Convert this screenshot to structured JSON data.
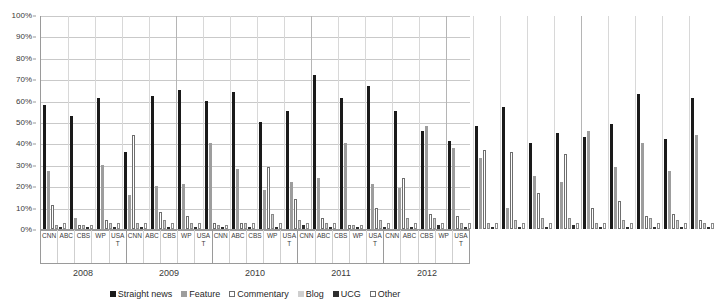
{
  "chart_data": {
    "type": "bar",
    "title": "",
    "subtitle": "",
    "xlabel": "",
    "ylabel": "",
    "ylim": [
      0,
      100
    ],
    "y_tick_labels": [
      "100%",
      "90%",
      "80%",
      "70%",
      "60%",
      "50%",
      "40%",
      "30%",
      "20%",
      "10%",
      "0%"
    ],
    "y_tick_values": [
      100,
      90,
      80,
      70,
      60,
      50,
      40,
      30,
      20,
      10,
      0
    ],
    "grid": "horizontal",
    "legend_position": "bottom",
    "group_labels": [
      "2008",
      "2009",
      "2010",
      "2011",
      "2012"
    ],
    "categories": [
      "CNN",
      "ABC",
      "CBS",
      "WP",
      "USA T"
    ],
    "series_names": [
      "Straight news",
      "Feature",
      "Commentary",
      "Blog",
      "UCG",
      "Other"
    ],
    "series_colors": [
      "#1a1a1a",
      "#9d9d9d",
      "#ffffff",
      "#cfcfcf",
      "#2f2f2f",
      "#ffffff"
    ],
    "groups": [
      {
        "year": "2008",
        "outlets": [
          {
            "name": "CNN",
            "values": [
              58,
              27,
              11,
              2,
              1,
              3
            ]
          },
          {
            "name": "ABC",
            "values": [
              53,
              5,
              2,
              2,
              1,
              2
            ]
          },
          {
            "name": "CBS",
            "values": [
              61,
              30,
              4,
              3,
              1,
              3
            ]
          },
          {
            "name": "WP",
            "values": [
              36,
              16,
              44,
              3,
              1,
              3
            ]
          },
          {
            "name": "USA T",
            "values": [
              62,
              20,
              8,
              4,
              1,
              3
            ]
          }
        ]
      },
      {
        "year": "2009",
        "outlets": [
          {
            "name": "CNN",
            "values": [
              65,
              21,
              6,
              3,
              1,
              3
            ]
          },
          {
            "name": "ABC",
            "values": [
              60,
              40,
              3,
              2,
              1,
              2
            ]
          },
          {
            "name": "CBS",
            "values": [
              64,
              28,
              3,
              3,
              1,
              3
            ]
          },
          {
            "name": "WP",
            "values": [
              50,
              18,
              29,
              7,
              1,
              3
            ]
          },
          {
            "name": "USA T",
            "values": [
              55,
              22,
              14,
              4,
              2,
              3
            ]
          }
        ]
      },
      {
        "year": "2010",
        "outlets": [
          {
            "name": "CNN",
            "values": [
              72,
              24,
              5,
              3,
              1,
              3
            ]
          },
          {
            "name": "ABC",
            "values": [
              61,
              40,
              2,
              2,
              1,
              2
            ]
          },
          {
            "name": "CBS",
            "values": [
              67,
              21,
              10,
              4,
              1,
              3
            ]
          },
          {
            "name": "WP",
            "values": [
              55,
              19,
              24,
              5,
              1,
              3
            ]
          },
          {
            "name": "USA T",
            "values": [
              46,
              48,
              7,
              5,
              2,
              3
            ]
          }
        ]
      },
      {
        "year": "2011",
        "outlets": [
          {
            "name": "CNN",
            "values": [
              41,
              38,
              6,
              3,
              1,
              3
            ]
          },
          {
            "name": "ABC",
            "values": [
              48,
              33,
              37,
              3,
              1,
              3
            ]
          },
          {
            "name": "CBS",
            "values": [
              57,
              10,
              36,
              4,
              1,
              3
            ]
          },
          {
            "name": "WP",
            "values": [
              40,
              25,
              17,
              5,
              1,
              3
            ]
          },
          {
            "name": "USA T",
            "values": [
              45,
              22,
              35,
              5,
              2,
              3
            ]
          }
        ]
      },
      {
        "year": "2012",
        "outlets": [
          {
            "name": "CNN",
            "values": [
              43,
              46,
              10,
              3,
              1,
              3
            ]
          },
          {
            "name": "ABC",
            "values": [
              49,
              29,
              13,
              4,
              1,
              3
            ]
          },
          {
            "name": "CBS",
            "values": [
              63,
              40,
              6,
              5,
              1,
              3
            ]
          },
          {
            "name": "WP",
            "values": [
              42,
              27,
              7,
              4,
              1,
              3
            ]
          },
          {
            "name": "USA T",
            "values": [
              61,
              44,
              4,
              3,
              1,
              3
            ]
          }
        ]
      }
    ]
  }
}
